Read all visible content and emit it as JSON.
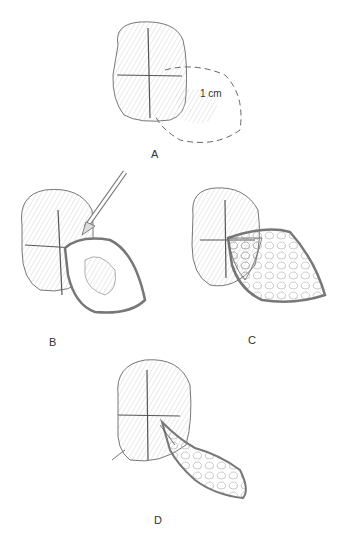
{
  "figure": {
    "panels": [
      {
        "id": "A",
        "label": "A",
        "annotation": "1 cm",
        "description": "Glans with cruciate marks and dashed outline of flap 1 cm margin"
      },
      {
        "id": "B",
        "label": "B",
        "description": "Scalpel incising along marked line, flap being raised"
      },
      {
        "id": "C",
        "label": "C",
        "description": "Flap reflected exposing tissue, quadrant opened"
      },
      {
        "id": "D",
        "label": "D",
        "description": "Flap rotated and sutured into position"
      }
    ]
  },
  "colors": {
    "line": "#555555",
    "shade": "#bbbbbb",
    "background": "#ffffff"
  }
}
